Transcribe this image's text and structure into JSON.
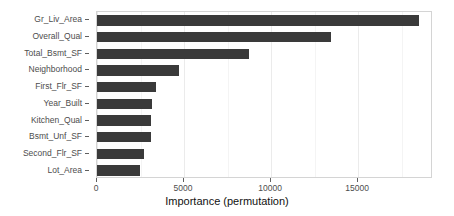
{
  "chart_data": {
    "type": "bar",
    "orientation": "horizontal",
    "title": "",
    "subtitle": "",
    "xlabel": "Importance (permutation)",
    "ylabel": "",
    "categories": [
      "Gr_Liv_Area",
      "Overall_Qual",
      "Total_Bsmt_SF",
      "Neighborhood",
      "First_Flr_SF",
      "Year_Built",
      "Kitchen_Qual",
      "Bsmt_Unf_SF",
      "Second_Flr_SF",
      "Lot_Area"
    ],
    "values": [
      18500,
      13450,
      8750,
      4700,
      3400,
      3150,
      3100,
      3100,
      2700,
      2450
    ],
    "xlim": [
      0,
      19300
    ],
    "ylim": [
      0,
      10
    ],
    "x_ticks": [
      0,
      5000,
      10000,
      15000
    ],
    "x_tick_labels": [
      "0",
      "5000",
      "10000",
      "15000"
    ],
    "x_minor_ticks": [
      2500,
      7500,
      12500,
      17500
    ],
    "grid": true,
    "grid_axis": "x",
    "legend": false,
    "legend_position": "none",
    "bar_color": "#3a3a3a",
    "panel_background": "#ffffff",
    "panel_border_color": "#d4d4d4",
    "gridline_major_color": "#ebebeb",
    "gridline_minor_color": "#f4f4f4",
    "axis_text_color": "#4d4d4d",
    "axis_title_color": "#111111"
  }
}
